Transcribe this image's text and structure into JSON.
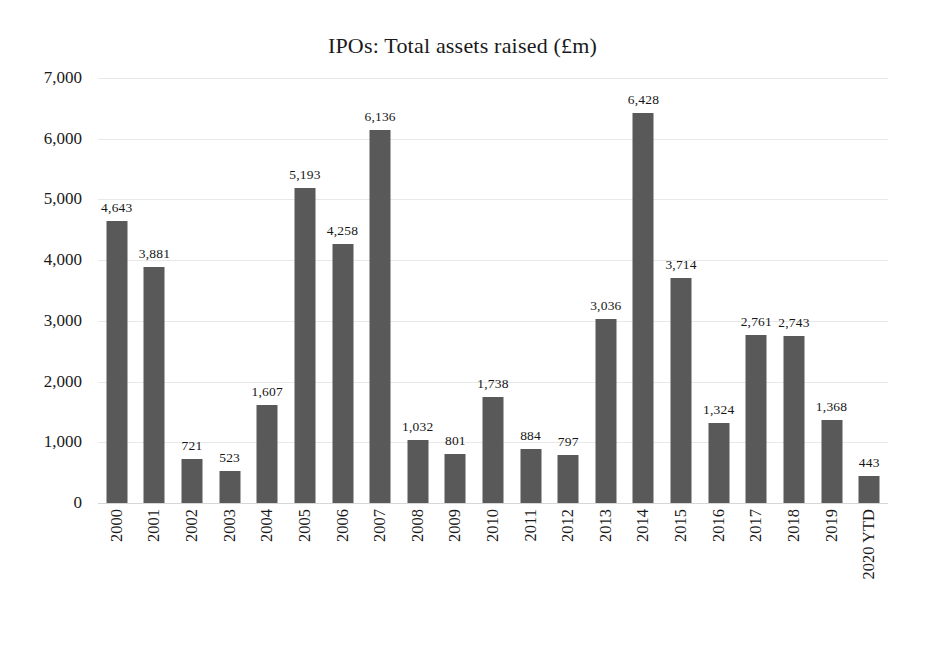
{
  "chart_data": {
    "type": "bar",
    "title": "IPOs: Total assets raised (£m)",
    "xlabel": "",
    "ylabel": "",
    "ylim": [
      0,
      7000
    ],
    "ytick_step": 1000,
    "yticks": [
      "0",
      "1,000",
      "2,000",
      "3,000",
      "4,000",
      "5,000",
      "6,000",
      "7,000"
    ],
    "ytick_values": [
      0,
      1000,
      2000,
      3000,
      4000,
      5000,
      6000,
      7000
    ],
    "grid": true,
    "legend": "none",
    "bar_color": "#595959",
    "gridline_color": "#e8e8e8",
    "data_labels": true,
    "categories": [
      "2000",
      "2001",
      "2002",
      "2003",
      "2004",
      "2005",
      "2006",
      "2007",
      "2008",
      "2009",
      "2010",
      "2011",
      "2012",
      "2013",
      "2014",
      "2015",
      "2016",
      "2017",
      "2018",
      "2019",
      "2020 YTD"
    ],
    "values": [
      4643,
      3881,
      721,
      523,
      1607,
      5193,
      4258,
      6136,
      1032,
      801,
      1738,
      884,
      797,
      3036,
      6428,
      3714,
      1324,
      2761,
      2743,
      1368,
      443
    ],
    "value_labels": [
      "4,643",
      "3,881",
      "721",
      "523",
      "1,607",
      "5,193",
      "4,258",
      "6,136",
      "1,032",
      "801",
      "1,738",
      "884",
      "797",
      "3,036",
      "6,428",
      "3,714",
      "1,324",
      "2,761",
      "2,743",
      "1,368",
      "443"
    ]
  }
}
